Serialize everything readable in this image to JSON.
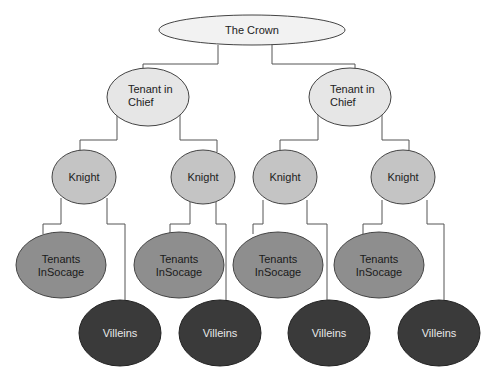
{
  "diagram": {
    "colors": {
      "crown": "#f2f2f2",
      "tenant_in_chief": "#e6e6e6",
      "knight": "#c4c4c4",
      "tenants_in_socage": "#8e8e8e",
      "villeins": "#3a3a3a",
      "stroke": "#444444",
      "line": "#555555"
    },
    "nodes": {
      "crown": {
        "label": "The Crown"
      },
      "tic1": {
        "line1": "Tenant in",
        "line2": "Chief"
      },
      "tic2": {
        "line1": "Tenant in",
        "line2": "Chief"
      },
      "knight1": {
        "label": "Knight"
      },
      "knight2": {
        "label": "Knight"
      },
      "knight3": {
        "label": "Knight"
      },
      "knight4": {
        "label": "Knight"
      },
      "socage1": {
        "line1": "Tenants",
        "line2": "InSocage"
      },
      "socage2": {
        "line1": "Tenants",
        "line2": "InSocage"
      },
      "socage3": {
        "line1": "Tenants",
        "line2": "InSocage"
      },
      "socage4": {
        "line1": "Tenants",
        "line2": "InSocage"
      },
      "villein1": {
        "label": "Villeins"
      },
      "villein2": {
        "label": "Villeins"
      },
      "villein3": {
        "label": "Villeins"
      },
      "villein4": {
        "label": "Villeins"
      }
    }
  }
}
